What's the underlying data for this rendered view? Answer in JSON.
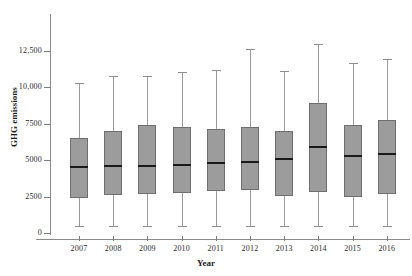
{
  "chart_data": {
    "type": "box",
    "title": "",
    "xlabel": "Year",
    "ylabel": "GHG emissions",
    "grid": false,
    "legend": false,
    "ylim": [
      0,
      13800
    ],
    "ytick_values": [
      0,
      2500,
      5000,
      7500,
      10000,
      12500
    ],
    "ytick_labels": [
      "0",
      "2500",
      "5000",
      "7500",
      "10,000",
      "12,500"
    ],
    "categories": [
      "2007",
      "2008",
      "2009",
      "2010",
      "2011",
      "2012",
      "2013",
      "2014",
      "2015",
      "2016"
    ],
    "boxes": [
      {
        "category": "2007",
        "whisker_low": 500,
        "q1": 2400,
        "median": 4500,
        "q3": 6500,
        "whisker_high": 10300
      },
      {
        "category": "2008",
        "whisker_low": 500,
        "q1": 2600,
        "median": 4600,
        "q3": 7000,
        "whisker_high": 10800
      },
      {
        "category": "2009",
        "whisker_low": 500,
        "q1": 2650,
        "median": 4600,
        "q3": 7400,
        "whisker_high": 10750
      },
      {
        "category": "2010",
        "whisker_low": 500,
        "q1": 2750,
        "median": 4700,
        "q3": 7300,
        "whisker_high": 11050
      },
      {
        "category": "2011",
        "whisker_low": 500,
        "q1": 2900,
        "median": 4800,
        "q3": 7150,
        "whisker_high": 11200
      },
      {
        "category": "2012",
        "whisker_low": 500,
        "q1": 2950,
        "median": 4900,
        "q3": 7250,
        "whisker_high": 12650
      },
      {
        "category": "2013",
        "whisker_low": 500,
        "q1": 2550,
        "median": 5050,
        "q3": 7000,
        "whisker_high": 11100
      },
      {
        "category": "2014",
        "whisker_low": 500,
        "q1": 2800,
        "median": 5900,
        "q3": 8950,
        "whisker_high": 13000
      },
      {
        "category": "2015",
        "whisker_low": 450,
        "q1": 2500,
        "median": 5300,
        "q3": 7400,
        "whisker_high": 11700
      },
      {
        "category": "2016",
        "whisker_low": 500,
        "q1": 2650,
        "median": 5400,
        "q3": 7750,
        "whisker_high": 11950
      }
    ],
    "colors": {
      "box_fill": "#9c9c9c",
      "box_border": "#6f6f6f",
      "median": "#1a1a1a",
      "whisker": "#9b9b9b",
      "axis": "#8a8a8a",
      "text": "#2b2b2b",
      "background": "#ffffff"
    }
  }
}
